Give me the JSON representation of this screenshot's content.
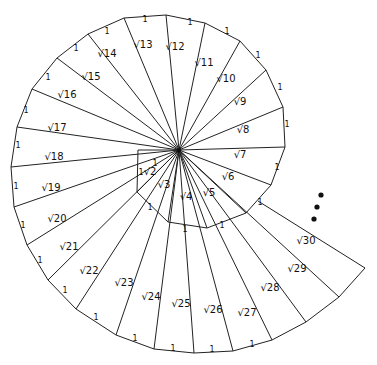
{
  "center": [
    179,
    150
  ],
  "vertices": [
    [
      138,
      150
    ],
    [
      137,
      192
    ],
    [
      168,
      222
    ],
    [
      207,
      228
    ],
    [
      246,
      213
    ],
    [
      271,
      185
    ],
    [
      285,
      147
    ],
    [
      283,
      107
    ],
    [
      266,
      70
    ],
    [
      240,
      41
    ],
    [
      205,
      23
    ],
    [
      166,
      15
    ],
    [
      124,
      18
    ],
    [
      88,
      34
    ],
    [
      57,
      58
    ],
    [
      32,
      89
    ],
    [
      17,
      127
    ],
    [
      11,
      167
    ],
    [
      14,
      207
    ],
    [
      27,
      245
    ],
    [
      48,
      280
    ],
    [
      76,
      309
    ],
    [
      116,
      335
    ],
    [
      154,
      349
    ],
    [
      194,
      353
    ],
    [
      233,
      351
    ],
    [
      272,
      340
    ],
    [
      306,
      322
    ],
    [
      339,
      297
    ],
    [
      365,
      268
    ]
  ],
  "hypotenuse_labels": [
    {
      "text": "√2",
      "x": 150,
      "y": 175
    },
    {
      "text": "√3",
      "x": 164,
      "y": 188
    },
    {
      "text": "√4",
      "x": 186,
      "y": 200
    },
    {
      "text": "√5",
      "x": 209,
      "y": 196
    },
    {
      "text": "√6",
      "x": 228,
      "y": 180
    },
    {
      "text": "√7",
      "x": 240,
      "y": 158
    },
    {
      "text": "√8",
      "x": 243,
      "y": 133
    },
    {
      "text": "√9",
      "x": 240,
      "y": 105
    },
    {
      "text": "√10",
      "x": 226,
      "y": 82
    },
    {
      "text": "√11",
      "x": 204,
      "y": 66
    },
    {
      "text": "√12",
      "x": 175,
      "y": 50
    },
    {
      "text": "√13",
      "x": 143,
      "y": 48
    },
    {
      "text": "√14",
      "x": 107,
      "y": 57
    },
    {
      "text": "√15",
      "x": 91,
      "y": 80
    },
    {
      "text": "√16",
      "x": 67,
      "y": 98
    },
    {
      "text": "√17",
      "x": 57,
      "y": 131
    },
    {
      "text": "√18",
      "x": 54,
      "y": 160
    },
    {
      "text": "√19",
      "x": 51,
      "y": 191
    },
    {
      "text": "√20",
      "x": 57,
      "y": 222
    },
    {
      "text": "√21",
      "x": 69,
      "y": 250
    },
    {
      "text": "√22",
      "x": 89,
      "y": 274
    },
    {
      "text": "√23",
      "x": 124,
      "y": 286
    },
    {
      "text": "√24",
      "x": 151,
      "y": 300
    },
    {
      "text": "√25",
      "x": 181,
      "y": 307
    },
    {
      "text": "√26",
      "x": 213,
      "y": 313
    },
    {
      "text": "√27",
      "x": 247,
      "y": 316
    },
    {
      "text": "√28",
      "x": 270,
      "y": 291
    },
    {
      "text": "√29",
      "x": 297,
      "y": 272
    },
    {
      "text": "√30",
      "x": 306,
      "y": 244
    }
  ],
  "unit_labels": [
    {
      "text": "1",
      "x": 155,
      "y": 166
    },
    {
      "text": "1",
      "x": 141,
      "y": 175
    },
    {
      "text": "1",
      "x": 150,
      "y": 210
    },
    {
      "text": "1",
      "x": 185,
      "y": 232
    },
    {
      "text": "1",
      "x": 222,
      "y": 228
    },
    {
      "text": "1",
      "x": 260,
      "y": 205
    },
    {
      "text": "1",
      "x": 277,
      "y": 170
    },
    {
      "text": "1",
      "x": 287,
      "y": 127
    },
    {
      "text": "1",
      "x": 280,
      "y": 90
    },
    {
      "text": "1",
      "x": 258,
      "y": 58
    },
    {
      "text": "1",
      "x": 227,
      "y": 34
    },
    {
      "text": "1",
      "x": 190,
      "y": 25
    },
    {
      "text": "1",
      "x": 145,
      "y": 22
    },
    {
      "text": "1",
      "x": 107,
      "y": 34
    },
    {
      "text": "1",
      "x": 76,
      "y": 51
    },
    {
      "text": "1",
      "x": 48,
      "y": 80
    },
    {
      "text": "1",
      "x": 26,
      "y": 113
    },
    {
      "text": "1",
      "x": 18,
      "y": 148
    },
    {
      "text": "1",
      "x": 16,
      "y": 189
    },
    {
      "text": "1",
      "x": 23,
      "y": 228
    },
    {
      "text": "1",
      "x": 40,
      "y": 263
    },
    {
      "text": "1",
      "x": 65,
      "y": 293
    },
    {
      "text": "1",
      "x": 96,
      "y": 320
    },
    {
      "text": "1",
      "x": 135,
      "y": 341
    },
    {
      "text": "1",
      "x": 173,
      "y": 351
    },
    {
      "text": "1",
      "x": 212,
      "y": 352
    },
    {
      "text": "1",
      "x": 252,
      "y": 347
    }
  ],
  "continuation_dots": [
    [
      321,
      195
    ],
    [
      317,
      207
    ],
    [
      314,
      219
    ]
  ]
}
